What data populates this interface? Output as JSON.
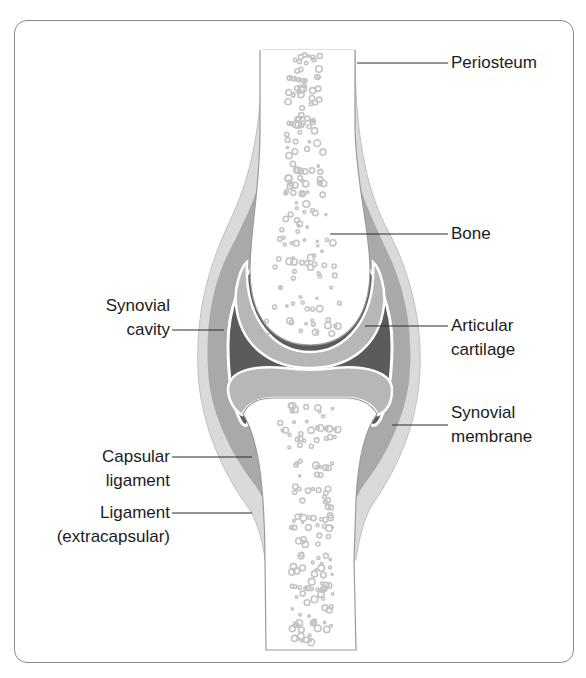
{
  "labels": {
    "periosteum": "Periosteum",
    "bone": "Bone",
    "synovial_cavity": [
      "Synovial",
      "cavity"
    ],
    "articular_cartilage": [
      "Articular",
      "cartilage"
    ],
    "synovial_membrane": [
      "Synovial",
      "membrane"
    ],
    "capsular_ligament": [
      "Capsular",
      "ligament"
    ],
    "ligament_extracapsular": [
      "Ligament",
      "(extracapsular)"
    ]
  },
  "colors": {
    "outer_ligament": "#d9d9d9",
    "capsule": "#a8a8a8",
    "cavity": "#5a5a5a",
    "cartilage": "#b5b5b5",
    "bone": "#ffffff",
    "bone_spots": "#c4c4c4",
    "outline": "#8a8a8a",
    "leader": "#2a2a2a"
  }
}
